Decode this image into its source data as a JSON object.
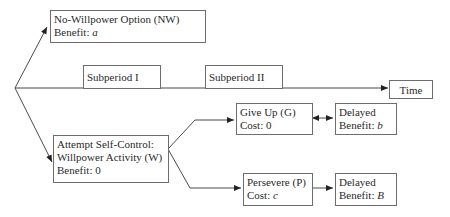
{
  "timeline": {
    "subperiod_1": "Subperiod I",
    "subperiod_2": "Subperiod II",
    "time_label": "Time"
  },
  "nodes": {
    "no_willpower": {
      "title": "No-Willpower Option (NW)",
      "prefix": "Benefit: ",
      "value": "a"
    },
    "willpower": {
      "line1": "Attempt Self-Control:",
      "line2": "Willpower Activity (W)",
      "line3": "Benefit: 0"
    },
    "give_up": {
      "title": "Give Up (G)",
      "line2": "Cost: 0"
    },
    "give_up_benefit": {
      "line1": "Delayed",
      "prefix": "Benefit: ",
      "value": "b"
    },
    "persevere": {
      "title": "Persevere (P)",
      "prefix": "Cost: ",
      "value": "c"
    },
    "persevere_benefit": {
      "line1": "Delayed",
      "prefix": "Benefit: ",
      "value": "B"
    }
  },
  "colors": {
    "line": "#4a4a4a",
    "border": "#6d6d6d",
    "text": "#2a2a2a"
  }
}
